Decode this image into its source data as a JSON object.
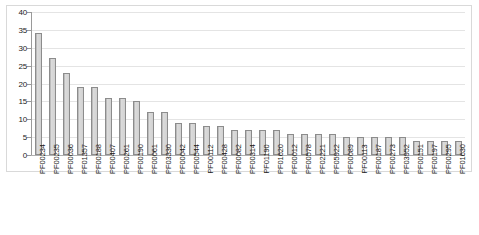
{
  "chart_data": {
    "type": "bar",
    "title": "",
    "subtitle": "",
    "xlabel": "",
    "ylabel": "",
    "ylim": [
      0,
      40
    ],
    "y_ticks": [
      0,
      5,
      10,
      15,
      20,
      25,
      30,
      35,
      40
    ],
    "grid": true,
    "legend": false,
    "legend_position": "none",
    "bar_fill_color": "#d3d3d3",
    "bar_border_color": "#8c8c8c",
    "gridline_color": "#e4e4e4",
    "plot_border_color": "#d9d9d9",
    "categories": [
      "PF00234",
      "PF00235",
      "PF00036",
      "PF01357",
      "PF00188",
      "PF00407",
      "PF00261",
      "PF00190",
      "PF00061",
      "PF03330",
      "PF00042",
      "PF00544",
      "PF00112",
      "PF00428",
      "PF00082",
      "PF00314",
      "PF01190",
      "PF01620",
      "PF00012",
      "PF00578",
      "PF02221",
      "PF05922",
      "PF00089",
      "PF00113",
      "PF00187",
      "PF00273",
      "PF03952",
      "PF00151",
      "PF00197",
      "PF00295",
      "PF01630"
    ],
    "values": [
      34,
      27,
      23,
      19,
      19,
      16,
      16,
      15,
      12,
      12,
      9,
      9,
      8,
      8,
      7,
      7,
      7,
      7,
      6,
      6,
      6,
      6,
      5,
      5,
      5,
      5,
      5,
      4,
      4,
      4,
      4
    ]
  }
}
